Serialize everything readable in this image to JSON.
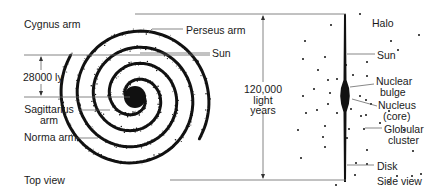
{
  "diagram": {
    "top_view": {
      "caption": "Top view",
      "labels": {
        "cygnus": "Cygnus arm",
        "perseus": "Perseus arm",
        "sun": "Sun",
        "distance": "28000 ly",
        "sagittarius_1": "Sagittarius",
        "sagittarius_2": "arm",
        "norma": "Norma arm"
      }
    },
    "measure": {
      "line1": "120,000",
      "line2": "light",
      "line3": "years"
    },
    "side_view": {
      "caption": "Side view",
      "labels": {
        "halo": "Halo",
        "sun": "Sun",
        "bulge_1": "Nuclear",
        "bulge_2": "bulge",
        "nucleus_1": "Nucleus",
        "nucleus_2": "(core)",
        "globular_1": "Globular",
        "globular_2": "cluster",
        "disk": "Disk"
      }
    },
    "colors": {
      "ink": "#111111",
      "leader": "#555555",
      "background": "#ffffff"
    }
  }
}
